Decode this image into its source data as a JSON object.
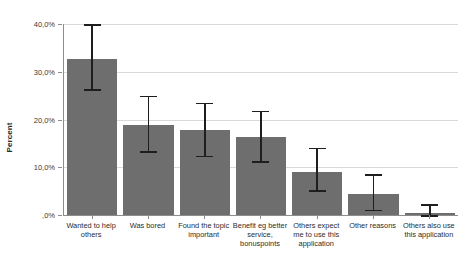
{
  "chart_data": {
    "type": "bar",
    "title": "",
    "xlabel": "",
    "ylabel": "Percent",
    "ylim": [
      0,
      40
    ],
    "grid": true,
    "legend": false,
    "y_tick_labels": [
      "40,0%",
      "30,0%",
      "20,0%",
      "10,0%",
      ",0%"
    ],
    "y_tick_values": [
      40,
      30,
      20,
      10,
      0
    ],
    "categories": [
      "Wanted to help others",
      "Was bored",
      "Found the topic important",
      "Benefit eg better service, bonuspoints",
      "Others expect me to use this application",
      "Other reasons",
      "Others also use this application"
    ],
    "values": [
      32.6,
      18.8,
      17.7,
      16.4,
      9.0,
      4.3,
      0.4
    ],
    "error_low": [
      26.3,
      13.4,
      12.4,
      11.3,
      5.2,
      1.1,
      0.0
    ],
    "error_high": [
      39.9,
      25.0,
      23.5,
      21.8,
      14.1,
      8.5,
      2.3
    ],
    "bar_color": "#6e6e6e",
    "error_color": "#1e1e1e",
    "grid_color": "#d9d9d9",
    "axis_color": "#8c8c8c",
    "background_color": "#ffffff"
  }
}
